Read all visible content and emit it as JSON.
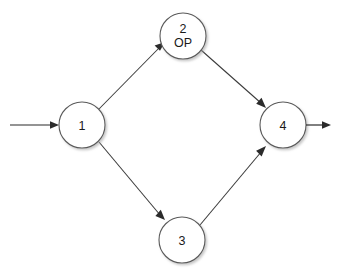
{
  "diagram": {
    "background_color": "#ffffff",
    "node_fill": "#ffffff",
    "node_stroke": "#5a5a5a",
    "edge_color": "#3a3a3a",
    "label_color": "#1a1a1a",
    "nodes": [
      {
        "id": "1",
        "label": "1",
        "sublabel": "",
        "cx": 82,
        "cy": 125,
        "r": 23
      },
      {
        "id": "2",
        "label": "2",
        "sublabel": "OP",
        "cx": 183,
        "cy": 36,
        "r": 23
      },
      {
        "id": "3",
        "label": "3",
        "sublabel": "",
        "cx": 182,
        "cy": 240,
        "r": 23
      },
      {
        "id": "4",
        "label": "4",
        "sublabel": "",
        "cx": 283,
        "cy": 125,
        "r": 23
      }
    ],
    "edges": [
      {
        "from": "1",
        "to": "2",
        "label": ""
      },
      {
        "from": "2",
        "to": "4",
        "label": ""
      },
      {
        "from": "1",
        "to": "3",
        "label": ""
      },
      {
        "from": "3",
        "to": "4",
        "label": ""
      }
    ],
    "entry_arrow": {
      "name": "entry-arrow",
      "x1": 10,
      "y1": 125,
      "x2": 59,
      "y2": 125
    },
    "exit_arrow": {
      "name": "exit-arrow",
      "x1": 306,
      "y1": 125,
      "x2": 331,
      "y2": 125
    }
  }
}
